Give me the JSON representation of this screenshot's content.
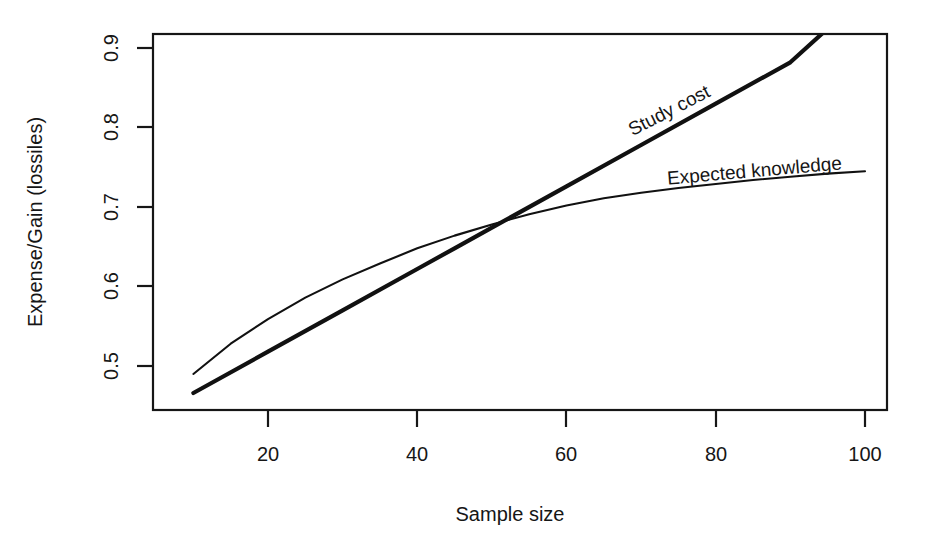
{
  "chart_data": {
    "type": "line",
    "title": "",
    "xlabel": "Sample size",
    "ylabel": "Expense/Gain (lossiles)",
    "xlim": [
      10,
      100
    ],
    "ylim": [
      0.455,
      0.935
    ],
    "grid": false,
    "legend_position": "inline-annotations",
    "xticks": [
      "20",
      "40",
      "60",
      "80",
      "100"
    ],
    "xtick_values": [
      20,
      40,
      60,
      80,
      100
    ],
    "yticks": [
      "0.5",
      "0.6",
      "0.7",
      "0.8",
      "0.9"
    ],
    "ytick_values": [
      0.5,
      0.6,
      0.7,
      0.8,
      0.9
    ],
    "series": [
      {
        "name": "Study cost",
        "style": "thick-straight",
        "x": [
          10,
          20,
          30,
          40,
          45,
          50,
          60,
          70,
          80,
          90,
          96
        ],
        "values": [
          0.466,
          0.518,
          0.57,
          0.622,
          0.648,
          0.674,
          0.726,
          0.778,
          0.83,
          0.882,
          0.933
        ]
      },
      {
        "name": "Expected knowledge",
        "style": "thin-concave",
        "x": [
          10,
          15,
          20,
          25,
          30,
          35,
          40,
          45,
          50,
          55,
          60,
          65,
          70,
          75,
          80,
          85,
          90,
          95,
          100
        ],
        "values": [
          0.49,
          0.528,
          0.559,
          0.586,
          0.609,
          0.629,
          0.648,
          0.664,
          0.678,
          0.691,
          0.702,
          0.711,
          0.718,
          0.724,
          0.729,
          0.734,
          0.738,
          0.742,
          0.745
        ]
      }
    ],
    "annotations": [
      {
        "text": "Study cost",
        "x": 68,
        "y": 0.8,
        "rotation": -27
      },
      {
        "text": "Expected knowledge",
        "x": 78,
        "y": 0.735,
        "rotation": -5
      }
    ],
    "crossing_point": {
      "x": 45,
      "y": 0.665
    }
  },
  "axes": {
    "y_title": "Expense/Gain (lossiles)",
    "x_title": "Sample size",
    "y_tick_labels": [
      "0.9",
      "0.8",
      "0.7",
      "0.6",
      "0.5"
    ],
    "x_tick_labels": [
      "20",
      "40",
      "60",
      "80",
      "100"
    ]
  },
  "labels": {
    "study_cost": "Study cost",
    "expected_knowledge": "Expected knowledge"
  },
  "colors": {
    "ink": "#161616",
    "background": "#ffffff"
  }
}
